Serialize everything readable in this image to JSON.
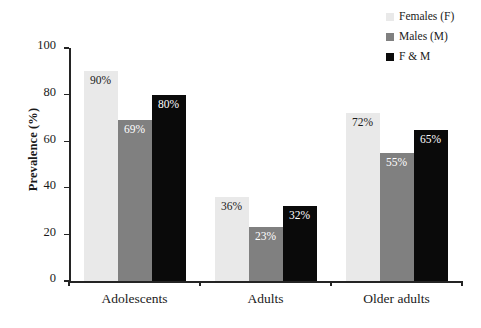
{
  "chart_data": {
    "type": "bar",
    "title": "",
    "xlabel": "",
    "ylabel": "Prevalence (%)",
    "ylim": [
      0,
      100
    ],
    "yticks": [
      "0",
      "20",
      "40",
      "60",
      "80",
      "100"
    ],
    "grid": false,
    "legend_position": "top-right",
    "categories": [
      "Adolescents",
      "Adults",
      "Older adults"
    ],
    "series": [
      {
        "name": "Females (F)",
        "color": "#e9e9e9",
        "values": [
          90,
          36,
          72
        ],
        "labels": [
          "90%",
          "36%",
          "72%"
        ],
        "label_color": "dark"
      },
      {
        "name": "Males (M)",
        "color": "#808080",
        "values": [
          69,
          23,
          55
        ],
        "labels": [
          "69%",
          "23%",
          "55%"
        ],
        "label_color": "light"
      },
      {
        "name": "F & M",
        "color": "#0a0a0a",
        "values": [
          80,
          32,
          65
        ],
        "labels": [
          "80%",
          "32%",
          "65%"
        ],
        "label_color": "light"
      }
    ]
  },
  "legend": {
    "items": [
      {
        "label": "Females (F)",
        "color": "#e9e9e9"
      },
      {
        "label": "Males (M)",
        "color": "#808080"
      },
      {
        "label": "F & M",
        "color": "#0a0a0a"
      }
    ]
  },
  "axis": {
    "y_title": "Prevalence (%)"
  }
}
